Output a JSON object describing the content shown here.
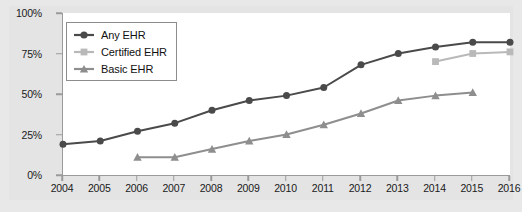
{
  "chart_data": {
    "type": "line",
    "title": "",
    "xlabel": "",
    "ylabel": "",
    "x": [
      2004,
      2005,
      2006,
      2007,
      2008,
      2009,
      2010,
      2011,
      2012,
      2013,
      2014,
      2015,
      2016
    ],
    "categories": [
      "2004",
      "2005",
      "2006",
      "2007",
      "2008",
      "2009",
      "2010",
      "2011",
      "2012",
      "2013",
      "2014",
      "2015",
      "2016"
    ],
    "ylim": [
      0,
      100
    ],
    "yticks": [
      0,
      25,
      50,
      75,
      100
    ],
    "ytick_labels": [
      "0%",
      "25%",
      "50%",
      "75%",
      "100%"
    ],
    "grid": false,
    "legend_position": "top-left",
    "series": [
      {
        "name": "Any EHR",
        "color": "#4a4a4a",
        "marker": "circle",
        "x": [
          2004,
          2005,
          2006,
          2007,
          2008,
          2009,
          2010,
          2011,
          2012,
          2013,
          2014,
          2015,
          2016
        ],
        "values": [
          19,
          21,
          27,
          32,
          40,
          46,
          49,
          54,
          68,
          75,
          79,
          82,
          82
        ]
      },
      {
        "name": "Certified EHR",
        "color": "#b9b9b9",
        "marker": "square",
        "x": [
          2014,
          2015,
          2016
        ],
        "values": [
          70,
          75,
          76
        ]
      },
      {
        "name": "Basic EHR",
        "color": "#8e8e8e",
        "marker": "triangle",
        "x": [
          2006,
          2007,
          2008,
          2009,
          2010,
          2011,
          2012,
          2013,
          2014,
          2015
        ],
        "values": [
          11,
          11,
          16,
          21,
          25,
          31,
          38,
          46,
          49,
          51
        ]
      }
    ]
  },
  "legend": {
    "items": [
      {
        "label": "Any EHR"
      },
      {
        "label": "Certified EHR"
      },
      {
        "label": "Basic EHR"
      }
    ]
  },
  "axes": {
    "y_labels": [
      "100%",
      "75%",
      "50%",
      "25%",
      "0%"
    ],
    "x_labels": [
      "2004",
      "2005",
      "2006",
      "2007",
      "2008",
      "2009",
      "2010",
      "2011",
      "2012",
      "2013",
      "2014",
      "2015",
      "2016"
    ]
  }
}
